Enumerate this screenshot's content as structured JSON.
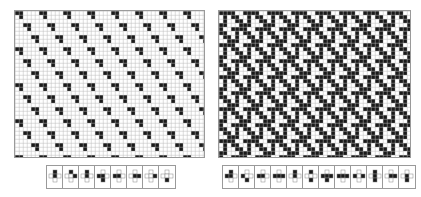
{
  "figure": {
    "panels": [
      {
        "id": "left",
        "description": "Tiling with sparse black L-shaped tiles on white grid",
        "x": 14,
        "y": 10,
        "width": 191,
        "height": 148,
        "cell_size": 4,
        "background": "#ffffff",
        "foreground": "#1a1a1a",
        "grid_color": "#b8b8b8",
        "density": "sparse"
      },
      {
        "id": "right",
        "description": "Tiling with dense black interlocking tiles on white grid",
        "x": 218,
        "y": 10,
        "width": 193,
        "height": 148,
        "cell_size": 4,
        "background": "#ffffff",
        "foreground": "#1a1a1a",
        "grid_color": "#b8b8b8",
        "density": "dense"
      }
    ],
    "legends": [
      {
        "id": "left-legend",
        "x": 46,
        "y": 165,
        "cells": [
          {
            "shape": "plus-top-vertical"
          },
          {
            "shape": "plus-top-right"
          },
          {
            "shape": "plus-top-center"
          },
          {
            "shape": "plus-left-bottom"
          },
          {
            "shape": "plus-left-center"
          },
          {
            "shape": "plus-center-right"
          },
          {
            "shape": "plus-right"
          },
          {
            "shape": "plus-bottom"
          }
        ]
      },
      {
        "id": "right-legend",
        "x": 222,
        "y": 165,
        "cells": [
          {
            "shape": "plus-left-top"
          },
          {
            "shape": "plus-left-bottom-diag"
          },
          {
            "shape": "plus-left-center"
          },
          {
            "shape": "plus-left-right"
          },
          {
            "shape": "plus-top-vertical"
          },
          {
            "shape": "plus-top-bottom-diag"
          },
          {
            "shape": "plus-horizontal-bottom"
          },
          {
            "shape": "plus-horizontal"
          },
          {
            "shape": "plus-left-right-center"
          },
          {
            "shape": "plus-vertical-center"
          },
          {
            "shape": "plus-right-center"
          },
          {
            "shape": "plus-bottom-center"
          }
        ]
      }
    ]
  }
}
